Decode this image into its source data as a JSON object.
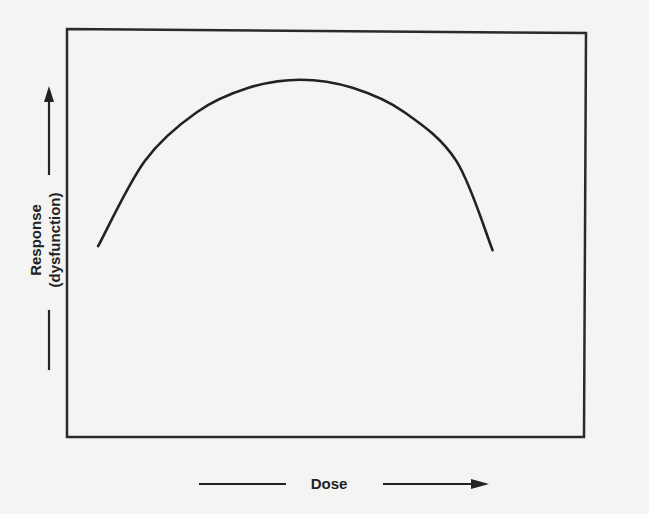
{
  "chart_data": {
    "type": "line",
    "title": "",
    "xlabel": "Dose",
    "ylabel": "Response",
    "ylabel_sub": "(dysfunction)",
    "grid": false,
    "legend": null,
    "axis_ticks": false,
    "series": [
      {
        "name": "response",
        "x": [
          0.06,
          0.15,
          0.25,
          0.35,
          0.45,
          0.55,
          0.65,
          0.75,
          0.82
        ],
        "y": [
          0.47,
          0.68,
          0.8,
          0.86,
          0.88,
          0.86,
          0.8,
          0.68,
          0.46
        ]
      }
    ],
    "xlim": [
      0,
      1
    ],
    "ylim": [
      0,
      1
    ]
  },
  "colors": {
    "background": "#f4f4f2",
    "ink": "#222222"
  }
}
